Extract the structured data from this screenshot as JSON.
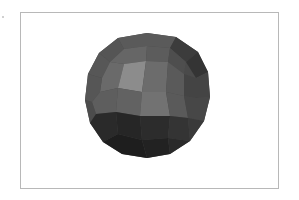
{
  "figure": {
    "frame_color": "#b8b8b8",
    "background": "#ffffff",
    "sphere": {
      "center": [
        147,
        95
      ],
      "radius": 62,
      "shades": {
        "highlight": "#8a8a8a",
        "light": "#707070",
        "mid": "#5e5e5e",
        "dark": "#3e3e3e",
        "darkest": "#1e1e1e"
      }
    }
  }
}
